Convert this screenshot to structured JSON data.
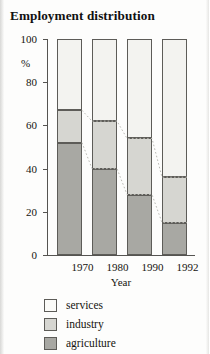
{
  "title": "Employment distribution",
  "axes": {
    "y_unit_label": "%",
    "y_ticks": [
      "0",
      "20",
      "40",
      "60",
      "80",
      "100"
    ],
    "x_title": "Year"
  },
  "legend": {
    "items": [
      {
        "label": "services",
        "swatch": "services-swatch",
        "color": "#fbfbf8"
      },
      {
        "label": "industry",
        "swatch": "industry-swatch",
        "color": "#d6d6d1"
      },
      {
        "label": "agriculture",
        "swatch": "agriculture-swatch",
        "color": "#a8a8a3"
      }
    ]
  },
  "chart_data": {
    "type": "bar",
    "stacked": true,
    "title": "Employment distribution",
    "xlabel": "Year",
    "ylabel": "%",
    "ylim": [
      0,
      100
    ],
    "yticks": [
      0,
      20,
      40,
      60,
      80,
      100
    ],
    "grid": false,
    "legend_position": "below",
    "categories": [
      "1970",
      "1980",
      "1990",
      "1992"
    ],
    "series": [
      {
        "name": "agriculture",
        "color": "#a8a8a3",
        "values": [
          52,
          40,
          28,
          15
        ]
      },
      {
        "name": "industry",
        "color": "#d6d6d1",
        "values": [
          15,
          22,
          26,
          21
        ]
      },
      {
        "name": "services",
        "color": "#f3f3f0",
        "values": [
          33,
          38,
          46,
          64
        ]
      }
    ],
    "cumulative_tops": {
      "agriculture": [
        52,
        40,
        28,
        15
      ],
      "industry": [
        67,
        62,
        54,
        36
      ],
      "services": [
        100,
        100,
        100,
        100
      ]
    },
    "annotations": [
      "dotted line connecting tops of agriculture segments",
      "dotted line connecting tops of industry segments"
    ]
  }
}
